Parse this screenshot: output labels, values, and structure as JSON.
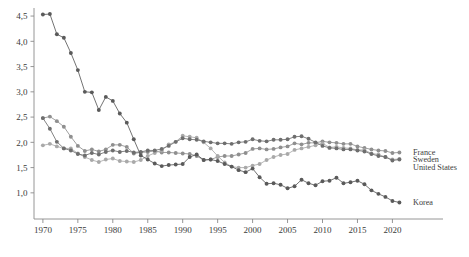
{
  "chart_data": {
    "type": "line",
    "title": "",
    "subtitle": "",
    "xlabel": "",
    "ylabel": "",
    "xlim": [
      1969.3,
      2021.8
    ],
    "ylim": [
      0.72,
      4.62
    ],
    "grid": false,
    "legend_position": "right-inline",
    "decimal_separator": ",",
    "y_ticks": [
      "1,0",
      "1,5",
      "2,0",
      "2,5",
      "3,0",
      "3,5",
      "4,0",
      "4,5"
    ],
    "y_tick_values": [
      1.0,
      1.5,
      2.0,
      2.5,
      3.0,
      3.5,
      4.0,
      4.5
    ],
    "x_ticks": [
      "1970",
      "1975",
      "1980",
      "1985",
      "1990",
      "1995",
      "2000",
      "2005",
      "2010",
      "2015",
      "2020"
    ],
    "x_tick_values": [
      1970,
      1975,
      1980,
      1985,
      1990,
      1995,
      2000,
      2005,
      2010,
      2015,
      2020
    ],
    "x": [
      1970,
      1971,
      1972,
      1973,
      1974,
      1975,
      1976,
      1977,
      1978,
      1979,
      1980,
      1981,
      1982,
      1983,
      1984,
      1985,
      1986,
      1987,
      1988,
      1989,
      1990,
      1991,
      1992,
      1993,
      1994,
      1995,
      1996,
      1997,
      1998,
      1999,
      2000,
      2001,
      2002,
      2003,
      2004,
      2005,
      2006,
      2007,
      2008,
      2009,
      2010,
      2011,
      2012,
      2013,
      2014,
      2015,
      2016,
      2017,
      2018,
      2019,
      2020,
      2021
    ],
    "series": [
      {
        "name": "France",
        "color": "#8f8f8f",
        "values": [
          2.48,
          2.51,
          2.42,
          2.31,
          2.11,
          1.93,
          1.83,
          1.86,
          1.82,
          1.86,
          1.95,
          1.95,
          1.91,
          1.78,
          1.8,
          1.81,
          1.83,
          1.8,
          1.8,
          1.79,
          1.78,
          1.77,
          1.73,
          1.65,
          1.66,
          1.71,
          1.73,
          1.73,
          1.76,
          1.79,
          1.87,
          1.88,
          1.86,
          1.87,
          1.9,
          1.92,
          1.98,
          1.96,
          1.99,
          1.99,
          2.02,
          2.0,
          1.99,
          1.97,
          1.97,
          1.92,
          1.89,
          1.86,
          1.84,
          1.83,
          1.79,
          1.8
        ]
      },
      {
        "name": "Sweden",
        "color": "#a9a9a9",
        "values": [
          1.94,
          1.97,
          1.92,
          1.88,
          1.88,
          1.78,
          1.71,
          1.65,
          1.61,
          1.66,
          1.68,
          1.63,
          1.62,
          1.61,
          1.65,
          1.73,
          1.79,
          1.84,
          1.96,
          2.01,
          2.13,
          2.11,
          2.09,
          2.0,
          1.88,
          1.73,
          1.6,
          1.52,
          1.5,
          1.5,
          1.54,
          1.57,
          1.65,
          1.71,
          1.75,
          1.77,
          1.85,
          1.88,
          1.91,
          1.94,
          1.98,
          1.9,
          1.91,
          1.89,
          1.88,
          1.85,
          1.85,
          1.78,
          1.76,
          1.71,
          1.66,
          1.67
        ]
      },
      {
        "name": "United States",
        "color": "#6e6e6e",
        "values": [
          2.48,
          2.27,
          2.01,
          1.88,
          1.84,
          1.77,
          1.74,
          1.79,
          1.76,
          1.81,
          1.84,
          1.81,
          1.83,
          1.8,
          1.81,
          1.84,
          1.84,
          1.87,
          1.93,
          2.01,
          2.08,
          2.06,
          2.05,
          2.02,
          2.0,
          1.98,
          1.98,
          1.97,
          2.0,
          2.01,
          2.06,
          2.03,
          2.02,
          2.05,
          2.05,
          2.06,
          2.11,
          2.12,
          2.07,
          2.0,
          1.93,
          1.89,
          1.88,
          1.86,
          1.86,
          1.84,
          1.82,
          1.77,
          1.73,
          1.71,
          1.64,
          1.66
        ]
      },
      {
        "name": "Korea",
        "color": "#5a5a5a",
        "values": [
          4.53,
          4.54,
          4.14,
          4.07,
          3.77,
          3.43,
          3.0,
          2.99,
          2.64,
          2.9,
          2.82,
          2.57,
          2.39,
          2.06,
          1.74,
          1.66,
          1.58,
          1.53,
          1.55,
          1.56,
          1.57,
          1.71,
          1.76,
          1.65,
          1.66,
          1.63,
          1.57,
          1.52,
          1.45,
          1.41,
          1.48,
          1.31,
          1.18,
          1.19,
          1.16,
          1.09,
          1.13,
          1.26,
          1.19,
          1.15,
          1.23,
          1.24,
          1.3,
          1.19,
          1.21,
          1.24,
          1.17,
          1.05,
          0.98,
          0.92,
          0.84,
          0.81
        ]
      }
    ],
    "legend": [
      {
        "label": "France",
        "value_at_end": 1.8
      },
      {
        "label": "Sweden",
        "value_at_end": 1.67
      },
      {
        "label": "United States",
        "value_at_end": 1.66
      },
      {
        "label": "Korea",
        "value_at_end": 0.81
      }
    ]
  },
  "layout": {
    "plot_left": 38,
    "plot_right": 405,
    "plot_top": 10,
    "plot_bottom": 207,
    "axis_color": "#8a8a8a"
  }
}
